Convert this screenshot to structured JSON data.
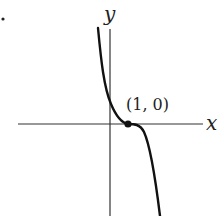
{
  "figure": {
    "marker": "•",
    "x_axis_label": "x",
    "y_axis_label": "y",
    "point": {
      "label": "(1, 0)",
      "x": 1,
      "y": 0
    },
    "curve_description": "decreasing cubic-like curve with inflection / flat point at (1, 0), y-intercept positive",
    "colors": {
      "curve": "#111111",
      "axes": "#333333",
      "background": "#ffffff"
    }
  }
}
